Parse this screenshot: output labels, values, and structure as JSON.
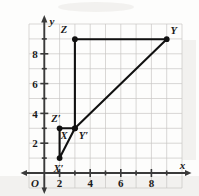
{
  "figure": {
    "name": "coordinate-plane-similar-triangles",
    "axes": {
      "x_axis_label": "x",
      "y_axis_label": "y",
      "origin_label": "O",
      "x_ticks": [
        {
          "value": 2,
          "label": "2"
        },
        {
          "value": 4,
          "label": "4"
        },
        {
          "value": 6,
          "label": "6"
        },
        {
          "value": 8,
          "label": "8"
        }
      ],
      "y_ticks": [
        {
          "value": 2,
          "label": "2"
        },
        {
          "value": 4,
          "label": "4"
        },
        {
          "value": 6,
          "label": "6"
        },
        {
          "value": 8,
          "label": "8"
        }
      ],
      "x_range": [
        -0.9,
        10.2
      ],
      "y_range": [
        -0.9,
        10.4
      ],
      "grid": true,
      "grid_step": 1
    },
    "shapes": [
      {
        "name": "large-triangle-XYZ",
        "vertices": [
          {
            "label": "X",
            "x": 3,
            "y": 3,
            "label_dx": -11,
            "label_dy": 11
          },
          {
            "label": "Y",
            "x": 9,
            "y": 9,
            "label_dx": 5,
            "label_dy": -5
          },
          {
            "label": "Z",
            "x": 3,
            "y": 9,
            "label_dx": -13,
            "label_dy": -6
          }
        ]
      },
      {
        "name": "small-triangle-X-prime-Y-prime-Z-prime",
        "vertices": [
          {
            "label": "X′",
            "x": 1,
            "y": 1,
            "label_dx": -2,
            "label_dy": 14
          },
          {
            "label": "Y′",
            "x": 3,
            "y": 3,
            "label_dx": 7,
            "label_dy": 11
          },
          {
            "label": "Z′",
            "x": 1,
            "y": 3,
            "label_dx": -4,
            "label_dy": -6
          }
        ]
      }
    ],
    "colors": {
      "grid": "#c9c6c4",
      "axis": "#3a3a3a",
      "figure_stroke": "#111111",
      "text": "#1a1a1a",
      "background": "#fdfdfc"
    }
  }
}
